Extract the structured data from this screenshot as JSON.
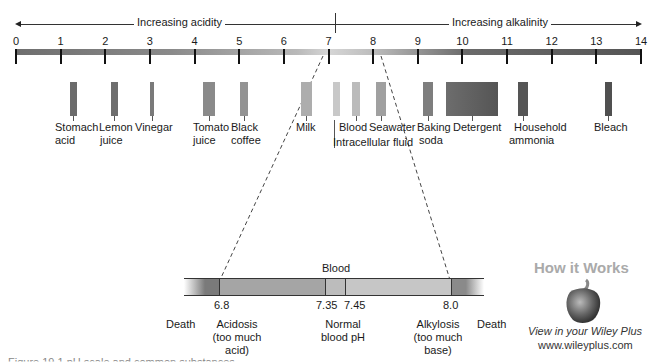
{
  "header": {
    "acidity_label": "Increasing acidity",
    "alkalinity_label": "Increasing alkalinity"
  },
  "scale": {
    "ticks": [
      "0",
      "1",
      "2",
      "3",
      "4",
      "5",
      "6",
      "7",
      "8",
      "9",
      "10",
      "11",
      "12",
      "13",
      "14"
    ]
  },
  "substances": [
    {
      "label": "Stomach acid",
      "line1": "Stomach",
      "line2": "acid",
      "ph": 1.0
    },
    {
      "label": "Lemon juice",
      "line1": "Lemon",
      "line2": "juice",
      "ph": 2.1
    },
    {
      "label": "Vinegar",
      "line1": "Vinegar",
      "line2": "",
      "ph": 3.0
    },
    {
      "label": "Tomato juice",
      "line1": "Tomato",
      "line2": "juice",
      "ph": 4.2
    },
    {
      "label": "Black coffee",
      "line1": "Black",
      "line2": "coffee",
      "ph": 5.0
    },
    {
      "label": "Milk",
      "line1": "Milk",
      "line2": "",
      "ph": 6.6
    },
    {
      "label": "Intracellular fluid",
      "line1": "Intracellular fluid",
      "line2": "",
      "ph": 7.0
    },
    {
      "label": "Blood",
      "line1": "Blood",
      "line2": "",
      "ph": 7.4
    },
    {
      "label": "Seawater",
      "line1": "Seawater",
      "line2": "",
      "ph": 8.0
    },
    {
      "label": "Baking soda",
      "line1": "Baking",
      "line2": "soda",
      "ph": 8.9
    },
    {
      "label": "Detergent",
      "line1": "Detergent",
      "line2": "",
      "ph": "9.5-10.6"
    },
    {
      "label": "Household ammonia",
      "line1": "Household",
      "line2": "ammonia",
      "ph": 11.0
    },
    {
      "label": "Bleach",
      "line1": "Bleach",
      "line2": "",
      "ph": 13.0
    }
  ],
  "blood_scale": {
    "title": "Blood",
    "values": [
      "6.8",
      "7.35",
      "7.45",
      "8.0"
    ],
    "zones": {
      "death_left": "Death",
      "acidosis": [
        "Acidosis",
        "(too much",
        "acid)"
      ],
      "normal": [
        "Normal",
        "blood pH"
      ],
      "alkylosis": [
        "Alkylosis",
        "(too much",
        "base)"
      ],
      "death_right": "Death"
    }
  },
  "logo": {
    "title": "How it Works",
    "icon": "pepper-icon",
    "subtitle": "View in your Wiley Plus",
    "url": "www.wileyplus.com"
  },
  "caption": {
    "text": "Figure 19.1  pH scale and common substances"
  }
}
